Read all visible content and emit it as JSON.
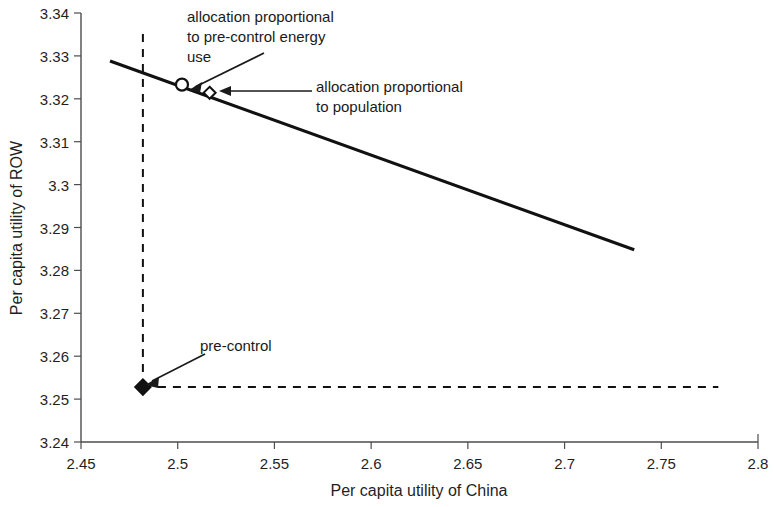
{
  "chart_data": {
    "type": "line",
    "title": "",
    "xlabel": "Per capita utility of China",
    "ylabel": "Per capita utility of ROW",
    "xlim": [
      2.45,
      2.8
    ],
    "ylim": [
      3.24,
      3.34
    ],
    "xticks": [
      "2.45",
      "2.5",
      "2.55",
      "2.6",
      "2.65",
      "2.7",
      "2.75",
      "2.8"
    ],
    "yticks": [
      "3.24",
      "3.25",
      "3.26",
      "3.27",
      "3.28",
      "3.29",
      "3.3",
      "3.31",
      "3.32",
      "3.33",
      "3.34"
    ],
    "xtick_values": [
      2.45,
      2.5,
      2.55,
      2.6,
      2.65,
      2.7,
      2.75,
      2.8
    ],
    "ytick_values": [
      3.24,
      3.25,
      3.26,
      3.27,
      3.28,
      3.29,
      3.3,
      3.31,
      3.32,
      3.33,
      3.34
    ],
    "grid": false,
    "legend": "none",
    "series": [
      {
        "name": "utility possibility frontier",
        "style": "solid",
        "color": "#111111",
        "x": [
          2.465,
          2.736
        ],
        "y": [
          3.3288,
          3.2848
        ]
      },
      {
        "name": "pre-control China utility reference",
        "style": "dashed",
        "color": "#111111",
        "x": [
          2.482,
          2.482
        ],
        "y": [
          3.2528,
          3.3365
        ]
      },
      {
        "name": "pre-control ROW utility reference",
        "style": "dashed",
        "color": "#111111",
        "x": [
          2.482,
          2.7795
        ],
        "y": [
          3.2528,
          3.2528
        ]
      }
    ],
    "points": [
      {
        "name": "allocation proportional to pre-control energy use",
        "marker": "open-circle",
        "x": 2.5022,
        "y": 3.3233
      },
      {
        "name": "allocation proportional to population",
        "marker": "open-diamond",
        "x": 2.5165,
        "y": 3.3214
      },
      {
        "name": "pre-control",
        "marker": "filled-diamond",
        "x": 2.482,
        "y": 3.2528
      }
    ],
    "annotations": [
      {
        "id": "energy",
        "lines": [
          "allocation proportional",
          "to pre-control energy",
          "use"
        ],
        "target": {
          "x": 2.5022,
          "y": 3.3233
        }
      },
      {
        "id": "population",
        "lines": [
          "allocation proportional",
          "to population"
        ],
        "target": {
          "x": 2.5165,
          "y": 3.3214
        }
      },
      {
        "id": "precontrol",
        "lines": [
          "pre-control"
        ],
        "target": {
          "x": 2.482,
          "y": 3.2528
        }
      }
    ]
  },
  "axis": {
    "x_title": "Per capita utility of China",
    "y_title": "Per capita utility of ROW"
  },
  "annotations": {
    "energy": {
      "line1": "allocation proportional",
      "line2": "to pre-control energy",
      "line3": "use"
    },
    "population": {
      "line1": "allocation proportional",
      "line2": "to population"
    },
    "precontrol": {
      "line1": "pre-control"
    }
  },
  "ticks": {
    "x": [
      "2.45",
      "2.5",
      "2.55",
      "2.6",
      "2.65",
      "2.7",
      "2.75",
      "2.8"
    ],
    "y": [
      "3.34",
      "3.33",
      "3.32",
      "3.31",
      "3.3",
      "3.29",
      "3.28",
      "3.27",
      "3.26",
      "3.25",
      "3.24"
    ]
  }
}
